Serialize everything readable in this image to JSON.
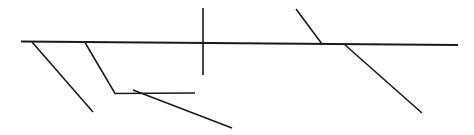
{
  "figure": {
    "width": 474,
    "height": 135,
    "background_color": "#ffffff",
    "stroke_color": "#1a1a1a",
    "default_stroke_width": 1.6
  },
  "strokes": [
    {
      "name": "main-baseline",
      "kind": "line",
      "x1": 21,
      "y1": 41.5,
      "x2": 458,
      "y2": 45,
      "width": 1.8,
      "color": "#1a1a1a"
    },
    {
      "name": "left-diagonal-outer",
      "kind": "line",
      "x1": 32,
      "y1": 42,
      "x2": 93,
      "y2": 112,
      "width": 1.6,
      "color": "#1a1a1a"
    },
    {
      "name": "left-diagonal-inner",
      "kind": "polyline",
      "points": "85,42.5 115,93.5 195,93",
      "width": 1.6,
      "color": "#1a1a1a"
    },
    {
      "name": "lower-descending-diagonal",
      "kind": "line",
      "x1": 133,
      "y1": 90,
      "x2": 232,
      "y2": 128,
      "width": 1.6,
      "color": "#1a1a1a"
    },
    {
      "name": "center-vertical-tick",
      "kind": "line",
      "x1": 203,
      "y1": 8,
      "x2": 203,
      "y2": 75,
      "width": 1.6,
      "color": "#1a1a1a"
    },
    {
      "name": "right-ascending-diagonal",
      "kind": "line",
      "x1": 296,
      "y1": 9,
      "x2": 322,
      "y2": 44,
      "width": 1.6,
      "color": "#1a1a1a"
    },
    {
      "name": "right-descending-diagonal",
      "kind": "line",
      "x1": 344,
      "y1": 44,
      "x2": 422,
      "y2": 113,
      "width": 1.6,
      "color": "#1a1a1a"
    }
  ]
}
